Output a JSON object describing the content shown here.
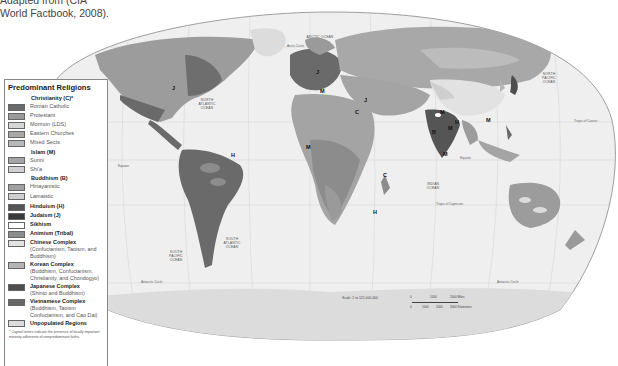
{
  "caption": {
    "text_line1": "Adapted from (CIA",
    "text_line2": "World Factbook, 2008)."
  },
  "legend": {
    "title": "Predominant Religions",
    "groups": [
      {
        "heading": "Christianity (C)*",
        "items": [
          {
            "label": "Roman Catholic",
            "color": "#6a6a6a"
          },
          {
            "label": "Protestant",
            "color": "#9a9a9a"
          },
          {
            "label": "Mormon (LDS)",
            "color": "#d6d6d6"
          },
          {
            "label": "Eastern Churches",
            "color": "#a8a8a8"
          },
          {
            "label": "Mixed Sects",
            "color": "#b8b8b8"
          }
        ]
      },
      {
        "heading": "Islam (M)",
        "items": [
          {
            "label": "Sunni",
            "color": "#a4a4a4"
          },
          {
            "label": "Shi'a",
            "color": "#d0d0d0"
          }
        ]
      },
      {
        "heading": "Buddhism (B)",
        "items": [
          {
            "label": "Hinayanistic",
            "color": "#a0a0a0"
          },
          {
            "label": "Lamaistic",
            "color": "#cfcfcf"
          }
        ]
      }
    ],
    "bold_items": [
      {
        "label": "Hinduism (H)",
        "sub": "",
        "color": "#555555"
      },
      {
        "label": "Judaism (J)",
        "sub": "",
        "color": "#3a3a3a"
      },
      {
        "label": "Sikhism",
        "sub": "",
        "color": "#ffffff"
      },
      {
        "label": "Animism (Tribal)",
        "sub": "",
        "color": "#8c8c8c"
      },
      {
        "label": "Chinese Complex",
        "sub": "(Confucianism, Taoism, and Buddhism)",
        "color": "#e2e2e2"
      },
      {
        "label": "Korean Complex",
        "sub": "(Buddhism, Confucianism, Christianity, and Chondogyo)",
        "color": "#b4b4b4"
      },
      {
        "label": "Japanese Complex",
        "sub": "(Shinto and Buddhism)",
        "color": "#4e4e4e"
      },
      {
        "label": "Vietnamese Complex",
        "sub": "(Buddhism, Taoism Confucianism, and Cao Dai)",
        "color": "#686868"
      },
      {
        "label": "Unpopulated Regions",
        "sub": "",
        "color": "#dcdcdc"
      }
    ],
    "footnote": "* Capital letters indicate the presence of locally important minority adherents of nonpredominant faiths."
  },
  "map": {
    "ocean_color": "#efefef",
    "border_color": "#888888",
    "ocean_labels": [
      {
        "text": "ARCTIC OCEAN",
        "x": 318,
        "y": 37
      },
      {
        "text": "NORTH ATLANTIC OCEAN",
        "x": 206,
        "y": 103
      },
      {
        "text": "NORTH PACIFIC OCEAN",
        "x": 548,
        "y": 77
      },
      {
        "text": "SOUTH PACIFIC OCEAN",
        "x": 175,
        "y": 254
      },
      {
        "text": "SOUTH ATLANTIC OCEAN",
        "x": 230,
        "y": 242
      },
      {
        "text": "INDIAN OCEAN",
        "x": 432,
        "y": 185
      }
    ],
    "line_labels": [
      {
        "text": "Arctic Circle",
        "x": 287,
        "y": 47
      },
      {
        "text": "Tropic of Cancer",
        "x": 574,
        "y": 122
      },
      {
        "text": "Equator",
        "x": 118,
        "y": 167
      },
      {
        "text": "Equator",
        "x": 460,
        "y": 159
      },
      {
        "text": "Tropic of Capricorn",
        "x": 436,
        "y": 205
      },
      {
        "text": "Antarctic Circle",
        "x": 141,
        "y": 283
      },
      {
        "text": "Antarctic Circle",
        "x": 497,
        "y": 283
      }
    ],
    "minority_letters": [
      {
        "text": "J",
        "x": 172,
        "y": 88
      },
      {
        "text": "J",
        "x": 316,
        "y": 72
      },
      {
        "text": "M",
        "x": 320,
        "y": 91
      },
      {
        "text": "J",
        "x": 364,
        "y": 100
      },
      {
        "text": "C",
        "x": 355,
        "y": 112
      },
      {
        "text": "M",
        "x": 440,
        "y": 112
      },
      {
        "text": "H",
        "x": 455,
        "y": 122
      },
      {
        "text": "M",
        "x": 448,
        "y": 128
      },
      {
        "text": "B",
        "x": 432,
        "y": 132
      },
      {
        "text": "M",
        "x": 443,
        "y": 154
      },
      {
        "text": "M",
        "x": 306,
        "y": 147
      },
      {
        "text": "H",
        "x": 231,
        "y": 155
      },
      {
        "text": "M",
        "x": 486,
        "y": 120
      },
      {
        "text": "C",
        "x": 383,
        "y": 175
      },
      {
        "text": "H",
        "x": 373,
        "y": 212
      }
    ],
    "scale": {
      "text": "Scale: 1 to 121,000,000",
      "miles_ticks": [
        "0",
        "1000",
        "2000 Miles"
      ],
      "km_ticks": [
        "0",
        "1000",
        "2000",
        "3000 Kilometers"
      ]
    }
  }
}
